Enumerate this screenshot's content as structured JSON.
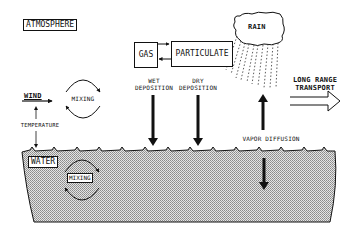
{
  "diagram": {
    "atmosphere_label": "ATMOSPHERE",
    "water_label": "WATER",
    "gas_label": "GAS",
    "particulate_label": "PARTICULATE",
    "rain_label": "RAIN",
    "wet_deposition_line1": "WET",
    "wet_deposition_line2": "DEPOSITION",
    "dry_deposition_line1": "DRY",
    "dry_deposition_line2": "DEPOSITION",
    "long_range_line1": "LONG RANGE",
    "long_range_line2": "TRANSPORT",
    "wind_label": "WIND",
    "air_mixing_label": "MIXING",
    "temperature_label": "TEMPERATURE",
    "vapor_diffusion_label": "VAPOR DIFFUSION",
    "water_mixing_label": "MIXING",
    "colors": {
      "ink": "#111111",
      "background": "#ffffff",
      "water_fill": "#c8c8c8"
    }
  }
}
